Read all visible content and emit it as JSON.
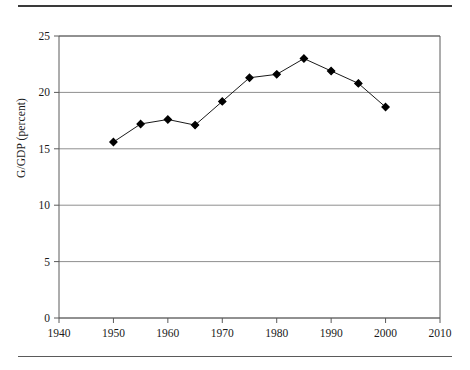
{
  "figure": {
    "has_top_rule": true,
    "has_bottom_rule": true,
    "caption_partial": ""
  },
  "chart_data": {
    "type": "line",
    "title": "",
    "xlabel": "",
    "ylabel": "G/GDP (percent)",
    "xlim": [
      1940,
      2010
    ],
    "ylim": [
      0,
      25
    ],
    "xticks": [
      1940,
      1950,
      1960,
      1970,
      1980,
      1990,
      2000,
      2010
    ],
    "yticks": [
      0,
      5,
      10,
      15,
      20,
      25
    ],
    "grid": "horizontal",
    "legend": "none",
    "marker": "diamond",
    "line_color": "#1a1a1a",
    "marker_color": "#000000",
    "grid_color": "#8f8f8f",
    "x": [
      1950,
      1955,
      1960,
      1965,
      1970,
      1975,
      1980,
      1985,
      1990,
      1995,
      2000
    ],
    "values": [
      15.6,
      17.2,
      17.6,
      17.1,
      19.2,
      21.3,
      21.6,
      23.0,
      21.9,
      20.8,
      18.7
    ],
    "series": [
      {
        "name": "G/GDP",
        "x": [
          1950,
          1955,
          1960,
          1965,
          1970,
          1975,
          1980,
          1985,
          1990,
          1995,
          2000
        ],
        "values": [
          15.6,
          17.2,
          17.6,
          17.1,
          19.2,
          21.3,
          21.6,
          23.0,
          21.9,
          20.8,
          18.7
        ]
      }
    ]
  }
}
